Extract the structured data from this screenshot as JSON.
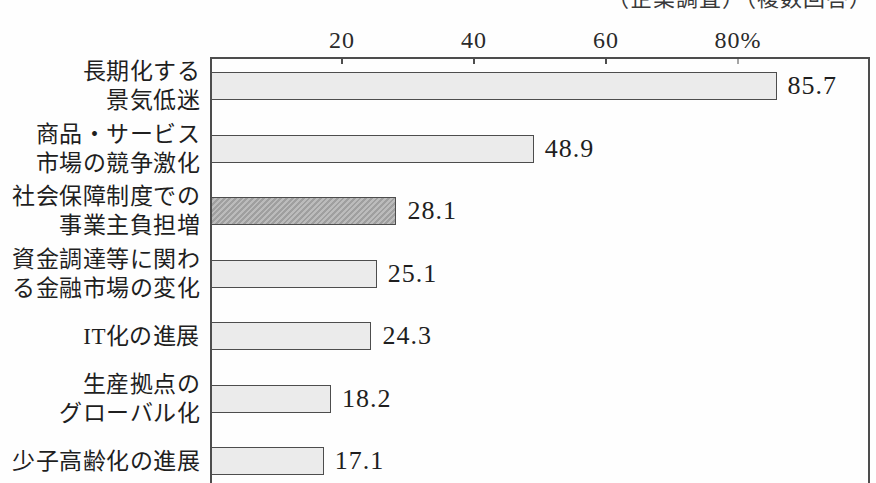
{
  "chart_data": {
    "type": "bar",
    "orientation": "horizontal",
    "note": "（企業調査）（複数回答）",
    "unit": "%",
    "xlim": [
      0,
      100
    ],
    "grid": false,
    "legend": false,
    "x_ticks": [
      {
        "value": 20,
        "label": "20"
      },
      {
        "value": 40,
        "label": "40"
      },
      {
        "value": 60,
        "label": "60"
      },
      {
        "value": 80,
        "label": "80%"
      }
    ],
    "categories": [
      "長期化する景気低迷",
      "商品・サービス市場の競争激化",
      "社会保障制度での事業主負担増",
      "資金調達等に関わる金融市場の変化",
      "IT化の進展",
      "生産拠点のグローバル化",
      "少子高齢化の進展"
    ],
    "values": [
      85.7,
      48.9,
      28.1,
      25.1,
      24.3,
      18.2,
      17.1
    ],
    "rows": [
      {
        "label_lines": [
          "長期化する",
          "景気低迷"
        ],
        "value": 85.7,
        "display": "85.7",
        "emphasized": false
      },
      {
        "label_lines": [
          "商品・サービス",
          "市場の競争激化"
        ],
        "value": 48.9,
        "display": "48.9",
        "emphasized": false
      },
      {
        "label_lines": [
          "社会保障制度での",
          "事業主負担増"
        ],
        "value": 28.1,
        "display": "28.1",
        "emphasized": true
      },
      {
        "label_lines": [
          "資金調達等に関わ",
          "る金融市場の変化"
        ],
        "value": 25.1,
        "display": "25.1",
        "emphasized": false
      },
      {
        "label_lines": [
          "IT化の進展"
        ],
        "value": 24.3,
        "display": "24.3",
        "emphasized": false
      },
      {
        "label_lines": [
          "生産拠点の",
          "グローバル化"
        ],
        "value": 18.2,
        "display": "18.2",
        "emphasized": false
      },
      {
        "label_lines": [
          "少子高齢化の進展"
        ],
        "value": 17.1,
        "display": "17.1",
        "emphasized": false
      }
    ],
    "colors": {
      "bar_fill": "#ebebeb",
      "bar_fill_emphasized": "#b4b4b4",
      "bar_border": "#4d4d4d",
      "axis": "#4d4d4d",
      "text": "#1f1f1f"
    }
  }
}
